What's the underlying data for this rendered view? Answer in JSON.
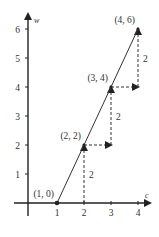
{
  "diagram": {
    "x_axis": {
      "label": "c",
      "ticks": [
        "1",
        "2",
        "3",
        "4"
      ],
      "range": [
        0,
        4.4
      ]
    },
    "y_axis": {
      "label": "w",
      "ticks": [
        "1",
        "2",
        "3",
        "4",
        "5",
        "6"
      ],
      "range": [
        0,
        6.5
      ]
    },
    "points": [
      {
        "x": 1,
        "y": 0,
        "label": "(1, 0)"
      },
      {
        "x": 2,
        "y": 2,
        "label": "(2, 2)"
      },
      {
        "x": 3,
        "y": 4,
        "label": "(3, 4)"
      },
      {
        "x": 4,
        "y": 6,
        "label": "(4, 6)"
      }
    ],
    "steps": [
      {
        "from": [
          2,
          0
        ],
        "to": [
          2,
          2
        ],
        "rise_label": "2"
      },
      {
        "from": [
          2,
          2
        ],
        "to": [
          3,
          2
        ],
        "run": true
      },
      {
        "from": [
          3,
          2
        ],
        "to": [
          3,
          4
        ],
        "rise_label": "2"
      },
      {
        "from": [
          3,
          4
        ],
        "to": [
          4,
          4
        ],
        "run": true
      },
      {
        "from": [
          4,
          4
        ],
        "to": [
          4,
          6
        ],
        "rise_label": "2"
      }
    ],
    "line_color": "#333333",
    "dash_color": "#333333"
  }
}
